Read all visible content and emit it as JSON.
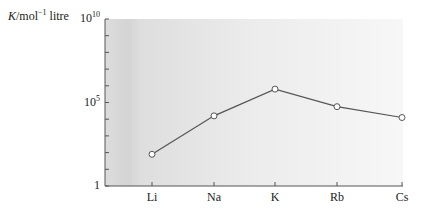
{
  "chart_data": {
    "type": "line",
    "title": "",
    "xlabel": "",
    "ylabel": "K/mol⁻¹ litre",
    "ylabel_parts": {
      "symbol": "K",
      "unit": "/mol",
      "exp": "−1",
      "suffix": " litre"
    },
    "yscale": "log",
    "ylim": [
      1,
      10000000000
    ],
    "y_ticks": [
      {
        "label_base": "10",
        "label_exp": "10",
        "value": 10000000000
      },
      {
        "label_base": "10",
        "label_exp": "5",
        "value": 100000
      },
      {
        "label_base": "1",
        "label_exp": "",
        "value": 1
      }
    ],
    "y_minor_ticks_per_decade": 1,
    "categories": [
      "Li",
      "Na",
      "K",
      "Rb",
      "Cs"
    ],
    "series": [
      {
        "name": "K",
        "log10_values": [
          1.9,
          4.2,
          5.8,
          4.75,
          4.1
        ],
        "values": [
          80,
          16000,
          630000,
          56000,
          12600
        ],
        "marker": "open-circle"
      }
    ],
    "grid": false,
    "legend": null
  },
  "colors": {
    "line": "#555555",
    "axis": "#555555",
    "marker_fill": "#ffffff",
    "bg_left": "#d9d9d9",
    "bg_right": "#f6f6f6"
  }
}
